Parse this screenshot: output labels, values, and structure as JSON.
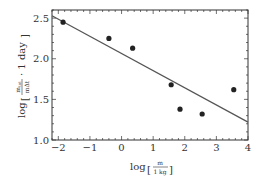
{
  "chart_data": {
    "type": "scatter",
    "title": "",
    "xlabel": "log [m / 1 kg]",
    "ylabel": "log [m_tot / (m Δt) · 1 day]",
    "xlim": [
      -2.2,
      4
    ],
    "ylim": [
      1.0,
      2.6
    ],
    "xticks": [
      -2,
      -1,
      0,
      1,
      2,
      3,
      4
    ],
    "yticks": [
      1.0,
      1.5,
      2.0,
      2.5
    ],
    "xtick_labels": [
      "−2",
      "−1",
      "0",
      "1",
      "2",
      "3",
      "4"
    ],
    "ytick_labels": [
      "1.0",
      "1.5",
      "2.0",
      "2.5"
    ],
    "grid": false,
    "legend": null,
    "series": [
      {
        "name": "data",
        "marker": "filled-circle",
        "points": [
          {
            "x": -1.85,
            "y": 2.45
          },
          {
            "x": -0.4,
            "y": 2.25
          },
          {
            "x": 0.35,
            "y": 2.13
          },
          {
            "x": 1.57,
            "y": 1.68
          },
          {
            "x": 1.85,
            "y": 1.38
          },
          {
            "x": 2.55,
            "y": 1.32
          },
          {
            "x": 3.55,
            "y": 1.62
          }
        ]
      },
      {
        "name": "linear fit",
        "type": "line",
        "points": [
          {
            "x": -2.2,
            "y": 2.53
          },
          {
            "x": 4.0,
            "y": 1.22
          }
        ]
      }
    ]
  },
  "labels": {
    "x_log": "log",
    "x_num": "m",
    "x_den": "1 kg",
    "y_log": "log",
    "y_num": "m",
    "y_num_sub": "tot",
    "y_den": "mΔt",
    "y_tail": "· 1 day"
  },
  "colors": {
    "frame": "#333333",
    "line": "#555555",
    "marker": "#222222"
  }
}
